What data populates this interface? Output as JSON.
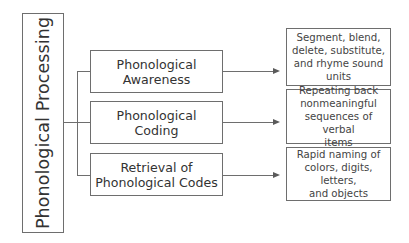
{
  "diagram": {
    "root": {
      "label": "Phonological Processing"
    },
    "components": [
      {
        "label": "Phonological\nAwareness",
        "description": "Segment, blend,\ndelete, substitute,\nand rhyme sound\nunits"
      },
      {
        "label": "Phonological\nCoding",
        "description": "Repeating back\nnonmeaningful\nsequences of verbal\nitems"
      },
      {
        "label": "Retrieval of\nPhonological Codes",
        "description": "Rapid naming of\ncolors, digits, letters,\nand objects"
      }
    ],
    "colors": {
      "border": "#6e6e6e",
      "text": "#333333",
      "background": "#ffffff"
    }
  }
}
